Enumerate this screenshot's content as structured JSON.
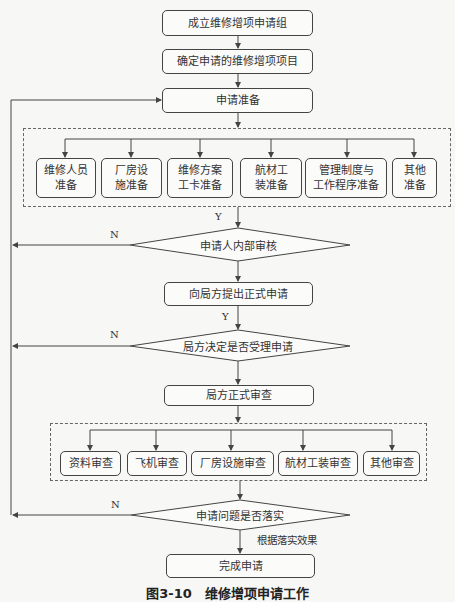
{
  "flowchart": {
    "steps": {
      "form_group": "成立维修增项申请组",
      "define_items": "确定申请的维修增项项目",
      "prepare": "申请准备",
      "submit_formal": "向局方提出正式申请",
      "authority_review": "局方正式审查",
      "complete": "完成申请"
    },
    "preparation_items": [
      "维修人员\n准备",
      "厂房设\n施准备",
      "维修方案\n工卡准备",
      "航材工\n装准备",
      "管理制度与\n工作程序准备",
      "其他\n准备"
    ],
    "review_items": [
      "资料审查",
      "飞机审查",
      "厂房设施审查",
      "航材工装审查",
      "其他审查"
    ],
    "decisions": {
      "internal_audit": "申请人内部审核",
      "accept_decision": "局方决定是否受理申请",
      "issues_resolved": "申请问题是否落实"
    },
    "labels": {
      "yes": "Y",
      "no": "N",
      "by_result": "根据落实效果"
    },
    "caption": "图3-10　维修增项申请工作"
  }
}
